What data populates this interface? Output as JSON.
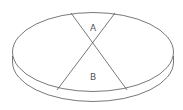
{
  "diagram": {
    "shape": "disc",
    "colors": {
      "stroke": "#555555",
      "background": "#ffffff"
    },
    "regions": [
      {
        "label": "A"
      },
      {
        "label": "B"
      }
    ]
  }
}
